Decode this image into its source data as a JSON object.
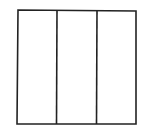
{
  "diagram": {
    "stroke_color": "#222222",
    "background": "#ffffff",
    "outer_box": {
      "x1": 18,
      "y1": 10,
      "x2": 136,
      "y2": 124
    },
    "dividers": [
      {
        "x_top": 57,
        "x_bottom": 56
      },
      {
        "x_top": 97,
        "x_bottom": 96
      }
    ],
    "sections": [
      {
        "label": ""
      },
      {
        "label": ""
      },
      {
        "label": ""
      }
    ]
  }
}
